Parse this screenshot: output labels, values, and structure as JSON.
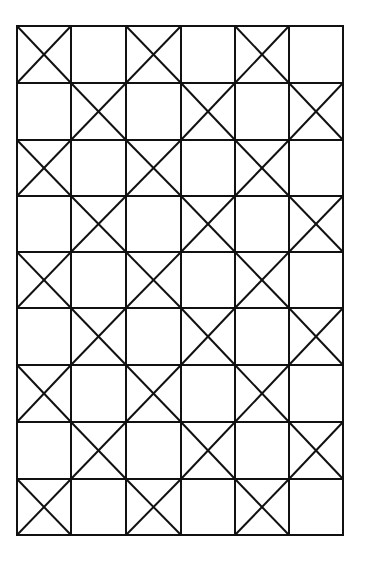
{
  "diagram": {
    "title": "",
    "type": "checkerboard-x-grid",
    "columns": 6,
    "rows": 9,
    "origin": {
      "x": 17,
      "y": 26
    },
    "col_edges": [
      17,
      71,
      126,
      181,
      235,
      289,
      343
    ],
    "row_edges": [
      26,
      83,
      140,
      196,
      252,
      308,
      365,
      422,
      479,
      535
    ],
    "line_color": "#111111",
    "background": "#ffffff",
    "stroke_width": 2,
    "pattern": [
      [
        1,
        0,
        1,
        0,
        1,
        0
      ],
      [
        0,
        1,
        0,
        1,
        0,
        1
      ],
      [
        1,
        0,
        1,
        0,
        1,
        0
      ],
      [
        0,
        1,
        0,
        1,
        0,
        1
      ],
      [
        1,
        0,
        1,
        0,
        1,
        0
      ],
      [
        0,
        1,
        0,
        1,
        0,
        1
      ],
      [
        1,
        0,
        1,
        0,
        1,
        0
      ],
      [
        0,
        1,
        0,
        1,
        0,
        1
      ],
      [
        1,
        0,
        1,
        0,
        1,
        0
      ]
    ],
    "legend": {
      "1": "cell with X diagonals",
      "0": "empty cell"
    }
  }
}
